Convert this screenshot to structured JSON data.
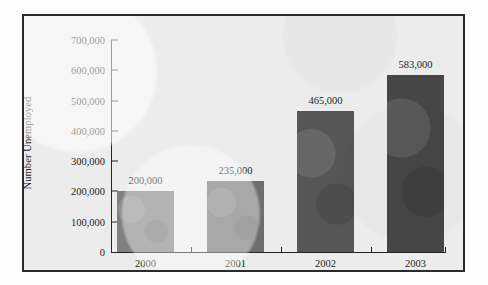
{
  "chart_data": {
    "type": "bar",
    "title": "",
    "subtitle": "",
    "xlabel": "",
    "ylabel": "Number Unemployed",
    "categories": [
      "2000",
      "2001",
      "2002",
      "2003"
    ],
    "values": [
      200000,
      235000,
      465000,
      583000
    ],
    "value_labels": [
      "200,000",
      "235,000",
      "465,000",
      "583,000"
    ],
    "ylim": [
      0,
      700000
    ],
    "y_ticks": [
      0,
      100000,
      200000,
      300000,
      400000,
      500000,
      600000,
      700000
    ],
    "y_tick_labels": [
      "0",
      "100,000",
      "200,000",
      "300,000",
      "400,000",
      "500,000",
      "600,000",
      "700,000"
    ],
    "grid": false,
    "legend": null,
    "bar_colors": [
      "#808080",
      "#6e6e6e",
      "#565656",
      "#464646"
    ],
    "plot_background": "#ececec",
    "frame_color": "#2a2a2a",
    "axis_color": "#252525",
    "text_color": "#1d1d1d"
  }
}
